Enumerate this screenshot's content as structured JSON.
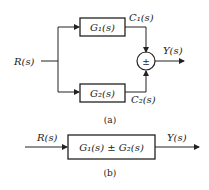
{
  "diagram_a": {
    "input_label": "R(s)",
    "block1_label": "G₁(s)",
    "block2_label": "G₂(s)",
    "c1_label": "C₁(s)",
    "c2_label": "C₂(s)",
    "sum_sign": "±",
    "output_label": "Y(s)",
    "caption": "(a)"
  },
  "diagram_b": {
    "input_label": "R(s)",
    "block_label": "G₁(s) ± G₂(s)",
    "output_label": "Y(s)",
    "caption": "(b)"
  }
}
